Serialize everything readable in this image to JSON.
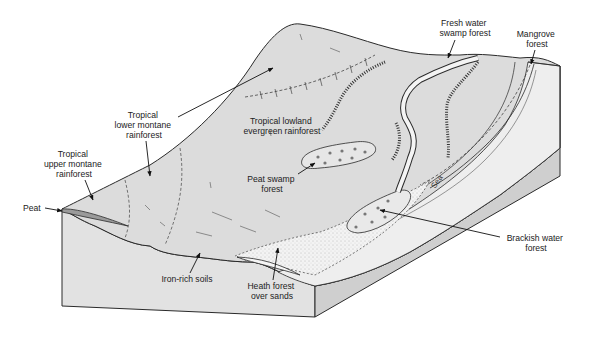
{
  "diagram": {
    "labels": {
      "fresh_water_swamp": [
        "Fresh water",
        "swamp forest"
      ],
      "mangrove": [
        "Mangrove",
        "forest"
      ],
      "lower_montane": [
        "Tropical",
        "lower montane",
        "rainforest"
      ],
      "upper_montane": [
        "Tropical",
        "upper montane",
        "rainforest"
      ],
      "lowland_evergreen": [
        "Tropical lowland",
        "evergreen rainforest"
      ],
      "peat_swamp": [
        "Peat swamp",
        "forest"
      ],
      "peat": [
        "Peat"
      ],
      "brackish": [
        "Brackish water",
        "forest"
      ],
      "iron_soils": [
        "Iron-rich soils"
      ],
      "heath": [
        "Heath forest",
        "over sands"
      ],
      "sea": [
        "Sea"
      ]
    },
    "colors": {
      "land": "#dcdcdc",
      "land_front": "#e3e3e3",
      "sand": "#f1f1f1",
      "shore": "#ececec",
      "peat": "#9a9a9a",
      "line": "#2a2a2a",
      "background": "#ffffff"
    }
  }
}
